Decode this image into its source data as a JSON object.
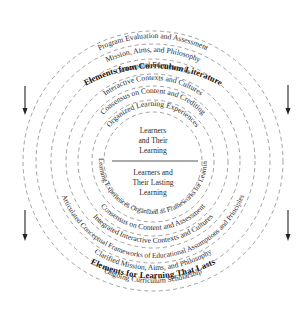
{
  "diagram": {
    "top_title": "Elements from Curriculum Literature",
    "bottom_title": "Elements for Learning That Lasts",
    "top_rings": [
      "Program Evaluation and Assessment",
      "Mission, Aims, and Philosophy",
      "Conceptual Frameworks",
      "Interactive Contexts and Cultures",
      "Consensus on Content and Crediting",
      "Organized Learning Experiences"
    ],
    "bottom_rings": [
      "Learning Experiences Organized as Frameworks for Learning",
      "Consensus on Content and Assessment",
      "Integrated Interactive Contexts and Cultures",
      "Articulated Conceptual Frameworks of Educational Assumptions and Principles",
      "Clarified Mission, Aims, and Philosophy",
      "Ongoing Curriculum Scholarship"
    ],
    "center": {
      "top_lines": [
        "Learners",
        "and Their",
        "Learning"
      ],
      "bottom_lines": [
        "Learners and",
        "Their Lasting",
        "Learning"
      ]
    },
    "arrows": [
      {
        "side": "left",
        "position": "upper",
        "direction": "down"
      },
      {
        "side": "left",
        "position": "lower",
        "direction": "down"
      },
      {
        "side": "right",
        "position": "upper",
        "direction": "down"
      },
      {
        "side": "right",
        "position": "lower",
        "direction": "down"
      }
    ],
    "colors": {
      "ring_stroke": "#8a8a8a",
      "text": "#2a2a2a",
      "title": "#111111",
      "background": "#ffffff"
    }
  }
}
